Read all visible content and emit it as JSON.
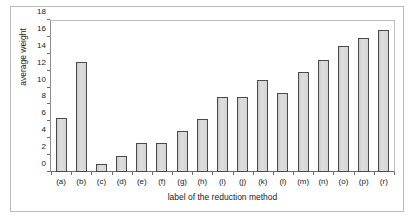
{
  "chart_data": {
    "type": "bar",
    "title": "",
    "subtitle": "",
    "xlabel": "label of the reduction method",
    "ylabel": "average weight",
    "categories": [
      "(a)",
      "(b)",
      "(c)",
      "(d)",
      "(e)",
      "(f)",
      "(g)",
      "(h)",
      "(i)",
      "(j)",
      "(k)",
      "(l)",
      "(m)",
      "(n)",
      "(o)",
      "(p)",
      "(r)"
    ],
    "values": [
      6.4,
      13.0,
      1.0,
      1.9,
      3.4,
      3.4,
      4.9,
      6.3,
      8.9,
      8.9,
      10.9,
      9.3,
      11.9,
      13.3,
      14.9,
      15.9,
      16.8
    ],
    "ylim": [
      0,
      18
    ],
    "ytick_values": [
      0,
      2,
      4,
      6,
      8,
      10,
      12,
      14,
      16,
      18
    ],
    "ytick_labels": [
      "0",
      "2",
      "4",
      "6",
      "8",
      "10",
      "12",
      "14",
      "16",
      "18"
    ],
    "grid": false,
    "legend": null,
    "legend_position": "none",
    "annotations": [],
    "colors": {
      "bar_fill": "#d6d6d6",
      "bar_border": "#4a4a4a",
      "axis": "#6d6d6d",
      "text": "#1a1a1a",
      "frame": "#b9b9b9",
      "background": "#ffffff"
    }
  }
}
